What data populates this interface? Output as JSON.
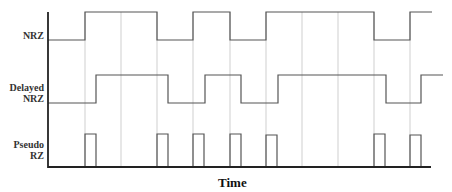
{
  "diagram": {
    "x_axis_label": "Time",
    "signals": [
      {
        "name": "NRZ",
        "label_lines": [
          "NRZ"
        ]
      },
      {
        "name": "Delayed NRZ",
        "label_lines": [
          "Delayed",
          "NRZ"
        ]
      },
      {
        "name": "Pseudo RZ",
        "label_lines": [
          "Pseudo",
          "RZ"
        ]
      }
    ],
    "bit_boundaries": 10,
    "nrz_bits": [
      0,
      1,
      1,
      0,
      1,
      0,
      1,
      1,
      1,
      0,
      1
    ],
    "delayed_nrz_bits": [
      0,
      1,
      1,
      0,
      1,
      0,
      1,
      1,
      1,
      0,
      1
    ],
    "pseudo_rz_pulses_at_boundaries": [
      1,
      3,
      4,
      5,
      6,
      9,
      10
    ],
    "colors": {
      "waveform": "#555555",
      "gridline": "#cccccc",
      "axis": "#222222"
    }
  }
}
